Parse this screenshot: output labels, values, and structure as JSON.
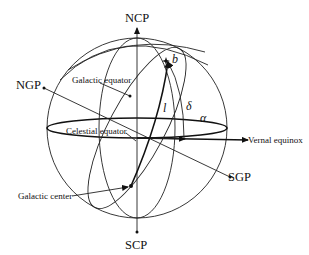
{
  "diagram": {
    "type": "celestial-sphere",
    "labels": {
      "ncp": "NCP",
      "scp": "SCP",
      "ngp": "NGP",
      "sgp": "SGP",
      "galactic_equator": "Galactic equator",
      "celestial_equator": "Celestial equator",
      "vernal_equinox": "Vernal equinox",
      "galactic_center": "Galactic center"
    },
    "symbols": {
      "galactic_latitude": "b",
      "galactic_longitude": "l",
      "declination": "δ",
      "right_ascension": "α"
    },
    "colors": {
      "line": "#222222",
      "background": "#ffffff"
    }
  }
}
